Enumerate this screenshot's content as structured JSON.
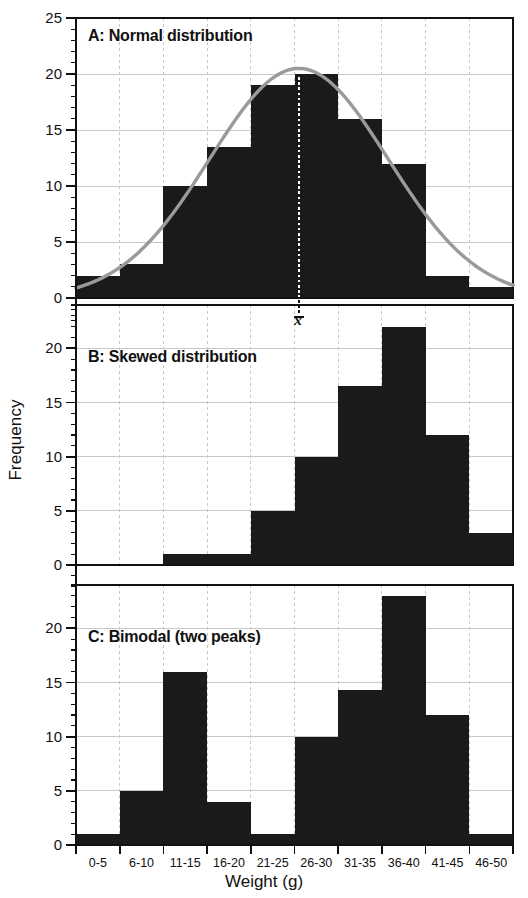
{
  "figure": {
    "xlabel": "Weight (g)",
    "ylabel": "Frequency",
    "mean_marker_label": "x̄"
  },
  "axis": {
    "y_ticks": [
      "0",
      "5",
      "10",
      "15",
      "20",
      "25"
    ],
    "y_ticks_bc": [
      "0",
      "5",
      "10",
      "15",
      "20"
    ],
    "x_ticks": [
      "0-5",
      "6-10",
      "11-15",
      "16-20",
      "21-25",
      "26-30",
      "31-35",
      "36-40",
      "41-45",
      "46-50"
    ]
  },
  "colors": {
    "bar_fill": "#1a1a1a",
    "curve": "#9a9a9a",
    "grid": "#c8c8c8",
    "axis": "#111111",
    "mean_line": "#ffffff",
    "background": "#ffffff"
  },
  "chart_data": [
    {
      "type": "bar",
      "title": "A: Normal distribution",
      "panel": "A",
      "categories": [
        "0-5",
        "6-10",
        "11-15",
        "16-20",
        "21-25",
        "26-30",
        "31-35",
        "36-40",
        "41-45",
        "46-50"
      ],
      "values": [
        2,
        3,
        10,
        13.5,
        19,
        20,
        16,
        12,
        2,
        1
      ],
      "xlabel": "Weight (g)",
      "ylabel": "Frequency",
      "ylim": [
        0,
        25
      ],
      "yticks": [
        0,
        5,
        10,
        15,
        20,
        25
      ],
      "grid": true,
      "legend": "none",
      "annotations": [
        {
          "label": "x̄",
          "type": "mean-line",
          "x_category": "26-30",
          "x_value": 25.5,
          "style": "white dotted vertical line"
        }
      ],
      "overlay": {
        "type": "line",
        "name": "normal curve",
        "color": "#9a9a9a",
        "mean": 25.5,
        "sigma": 10.2,
        "peak": 20.5
      }
    },
    {
      "type": "bar",
      "title": "B: Skewed distribution",
      "panel": "B",
      "categories": [
        "0-5",
        "6-10",
        "11-15",
        "16-20",
        "21-25",
        "26-30",
        "31-35",
        "36-40",
        "41-45",
        "46-50"
      ],
      "values": [
        0,
        0,
        1,
        1,
        5,
        10,
        16.5,
        22,
        12,
        3
      ],
      "xlabel": "Weight (g)",
      "ylabel": "Frequency",
      "ylim": [
        0,
        25
      ],
      "yticks": [
        0,
        5,
        10,
        15,
        20
      ],
      "grid": true,
      "legend": "none"
    },
    {
      "type": "bar",
      "title": "C: Bimodal (two peaks)",
      "panel": "C",
      "categories": [
        "0-5",
        "6-10",
        "11-15",
        "16-20",
        "21-25",
        "26-30",
        "31-35",
        "36-40",
        "41-45",
        "46-50"
      ],
      "values": [
        1,
        5,
        16,
        4,
        1,
        10,
        14.3,
        23,
        12,
        1
      ],
      "xlabel": "Weight (g)",
      "ylabel": "Frequency",
      "ylim": [
        0,
        25
      ],
      "yticks": [
        0,
        5,
        10,
        15,
        20
      ],
      "grid": true,
      "legend": "none"
    }
  ]
}
